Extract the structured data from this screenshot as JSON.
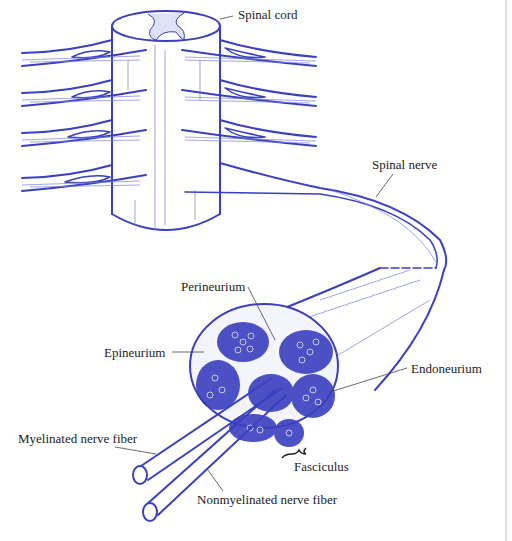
{
  "diagram": {
    "ink_color": "#3a3fc0",
    "labels": {
      "spinal_cord": "Spinal cord",
      "spinal_nerve": "Spinal nerve",
      "perineurium": "Perineurium",
      "epineurium": "Epineurium",
      "endoneurium": "Endoneurium",
      "myelinated": "Myelinated nerve fiber",
      "nonmyelinated": "Nonmyelinated nerve fiber",
      "fasciculus": "Fasciculus"
    }
  }
}
